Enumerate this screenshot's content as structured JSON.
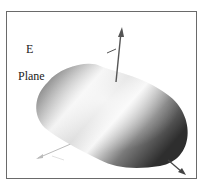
{
  "figure": {
    "title_line1": "E",
    "title_line2": "Plane",
    "axes": [
      "z-axis",
      "x-axis",
      "y-axis"
    ],
    "colors": {
      "frame": "#6a6a6a",
      "surface_dark": "#3c3c3c",
      "surface_light": "#f4f4f4",
      "axis": "#555555",
      "axis_faint": "#bbbbbb"
    }
  }
}
